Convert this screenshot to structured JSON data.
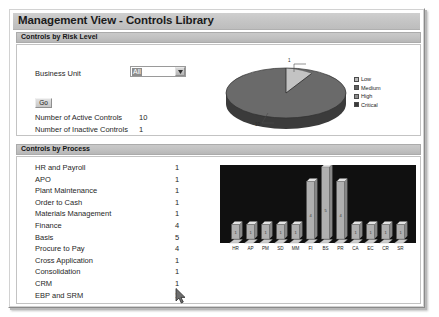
{
  "window": {
    "title": "Management View - Controls Library"
  },
  "sections": {
    "risk_level": {
      "header": "Controls by Risk Level",
      "business_unit_label": "Business Unit",
      "business_unit_value": "All",
      "business_unit_options": [
        "All"
      ],
      "go_label": "Go",
      "active_controls_label": "Number of Active Controls",
      "active_controls_value": "10",
      "inactive_controls_label": "Number of Inactive Controls",
      "inactive_controls_value": "1"
    },
    "process": {
      "header": "Controls by Process",
      "rows": [
        {
          "name": "HR and Payroll",
          "count": "1"
        },
        {
          "name": "APO",
          "count": "1"
        },
        {
          "name": "Plant Maintenance",
          "count": "1"
        },
        {
          "name": "Order to Cash",
          "count": "1"
        },
        {
          "name": "Materials Management",
          "count": "1"
        },
        {
          "name": "Finance",
          "count": "4"
        },
        {
          "name": "Basis",
          "count": "5"
        },
        {
          "name": "Procure to Pay",
          "count": "4"
        },
        {
          "name": "Cross Application",
          "count": "1"
        },
        {
          "name": "Consolidation",
          "count": "1"
        },
        {
          "name": "CRM",
          "count": "1"
        },
        {
          "name": "EBP and SRM",
          "count": "1"
        }
      ]
    }
  },
  "chart_data": [
    {
      "type": "pie",
      "title": "",
      "labels": [
        "Low",
        "Medium",
        "High",
        "Critical"
      ],
      "values": [
        10,
        1,
        0,
        0
      ],
      "data_labels": [
        "10",
        "1"
      ],
      "colors": [
        "#b9b9b9",
        "#5e5e5e",
        "#8e8e8e",
        "#3a3a3a"
      ],
      "legend_position": "right",
      "three_d": true
    },
    {
      "type": "bar",
      "title": "",
      "categories": [
        "HR",
        "AP",
        "PM",
        "SD",
        "MM",
        "FI",
        "BS",
        "PR",
        "CA",
        "EC",
        "CR",
        "SR"
      ],
      "values": [
        1,
        1,
        1,
        1,
        1,
        4,
        5,
        4,
        1,
        1,
        1,
        1
      ],
      "bar_labels": [
        "1",
        "1",
        "1",
        "1",
        "1",
        "4",
        "5",
        "4",
        "1",
        "1",
        "1",
        "1"
      ],
      "xlabel": "",
      "ylabel": "",
      "ylim": [
        0,
        5
      ],
      "grid": false,
      "background_color": "#101010",
      "bar_color": "#b0b0b0",
      "three_d": true
    }
  ]
}
